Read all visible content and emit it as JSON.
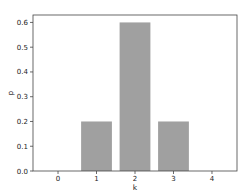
{
  "chart_data": {
    "type": "bar",
    "title": "",
    "xlabel": "k",
    "ylabel": "p",
    "categories": [
      "1",
      "2",
      "3"
    ],
    "x": [
      1,
      2,
      3
    ],
    "values": [
      0.2,
      0.6,
      0.2
    ],
    "bar_width": 0.8,
    "bar_color": "#a0a0a0",
    "xlim": [
      -0.65,
      4.65
    ],
    "ylim": [
      0,
      0.63
    ],
    "xticks": [
      0,
      1,
      2,
      3,
      4
    ],
    "xtick_labels": [
      "0",
      "1",
      "2",
      "3",
      "4"
    ],
    "yticks": [
      0.0,
      0.1,
      0.2,
      0.3,
      0.4,
      0.5,
      0.6
    ],
    "ytick_labels": [
      "0.0",
      "0.1",
      "0.2",
      "0.3",
      "0.4",
      "0.5",
      "0.6"
    ],
    "grid": false,
    "legend": null
  },
  "layout": {
    "axes": {
      "left": 33,
      "top": 15,
      "right": 237,
      "bottom": 171
    }
  }
}
